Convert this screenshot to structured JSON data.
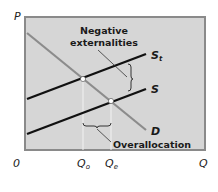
{
  "diagram": {
    "type": "supply-demand-externality",
    "axes": {
      "y_label": "P",
      "x_label": "Q",
      "origin_label": "0"
    },
    "curves": {
      "social_supply": {
        "label": "S",
        "subscript": "t"
      },
      "supply": {
        "label": "S"
      },
      "demand": {
        "label": "D"
      }
    },
    "x_ticks": {
      "optimal": {
        "label": "Q",
        "subscript": "o"
      },
      "equilibrium": {
        "label": "Q",
        "subscript": "e"
      }
    },
    "annotations": {
      "externality_line1": "Negative",
      "externality_line2": "externalities",
      "overallocation": "Overallocation"
    },
    "colors": {
      "plot_background": "#d6d6d6",
      "plot_border": "#8a8a8a",
      "supply_curves": "#111111",
      "demand_curve": "#8c8c8c",
      "guide_lines": "#f2f2f2"
    }
  }
}
